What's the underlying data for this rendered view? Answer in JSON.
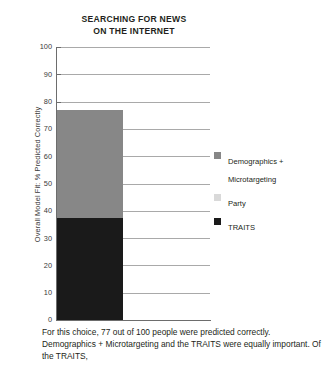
{
  "chart_data": {
    "type": "bar",
    "title": "SEARCHING FOR NEWS ON THE INTERNET",
    "title_line1": "SEARCHING FOR NEWS",
    "title_line2": "ON THE INTERNET",
    "xlabel": "",
    "ylabel": "Overall Model Fit: % Predicted Correctly",
    "ylim": [
      0,
      100
    ],
    "ytick_step": 10,
    "yticks": [
      100,
      90,
      80,
      70,
      60,
      50,
      40,
      30,
      20,
      10,
      0
    ],
    "grid": true,
    "stacked": true,
    "legend_position": "right",
    "categories": [
      "Searching for news on the internet"
    ],
    "total": 77,
    "series": [
      {
        "name": "Demographics + Microtargeting",
        "values": [
          39.5
        ],
        "color": "#878787"
      },
      {
        "name": "Party",
        "values": [
          0
        ],
        "color": "#d9d9d9"
      },
      {
        "name": "TRAITS",
        "values": [
          37.5
        ],
        "color": "#1a1a1a"
      }
    ],
    "stack_order_bottom_to_top": [
      "TRAITS",
      "Party",
      "Demographics + Microtargeting"
    ],
    "annotations": []
  },
  "legend": {
    "items": [
      {
        "label": "Demographics + Microtargeting",
        "color": "#878787"
      },
      {
        "label": "Party",
        "color": "#d9d9d9"
      },
      {
        "label": "TRAITS",
        "color": "#1a1a1a"
      }
    ]
  },
  "caption": {
    "text": "For this choice, 77 out of 100 people were predicted correctly. Demographics + Microtargeting and the TRAITS were equally important. Of the TRAITS,"
  },
  "colors": {
    "demographics": "#878787",
    "party": "#d9d9d9",
    "traits": "#1a1a1a",
    "gridline": "#a9a9a9",
    "axis": "#6d6d6d",
    "text": "#231f20"
  }
}
